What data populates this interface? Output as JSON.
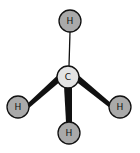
{
  "diagram": {
    "atoms": [
      {
        "id": "C",
        "label": "C",
        "x": 68,
        "y": 77,
        "r": 11,
        "fill": "#e3e3e3"
      },
      {
        "id": "H1",
        "label": "H",
        "x": 70,
        "y": 21,
        "r": 11,
        "fill": "#a9a9a9"
      },
      {
        "id": "H2",
        "label": "H",
        "x": 18,
        "y": 107,
        "r": 11,
        "fill": "#a9a9a9"
      },
      {
        "id": "H3",
        "label": "H",
        "x": 120,
        "y": 107,
        "r": 11,
        "fill": "#a9a9a9"
      },
      {
        "id": "H4",
        "label": "H",
        "x": 69,
        "y": 133,
        "r": 11,
        "fill": "#a9a9a9"
      }
    ],
    "bonds": [
      {
        "from": "C",
        "to": "H1",
        "style": "line"
      },
      {
        "from": "C",
        "to": "H2",
        "style": "wedge"
      },
      {
        "from": "C",
        "to": "H3",
        "style": "wedge"
      },
      {
        "from": "C",
        "to": "H4",
        "style": "wedge"
      }
    ],
    "colors": {
      "stroke": "#111111",
      "bond": "#111111"
    }
  }
}
